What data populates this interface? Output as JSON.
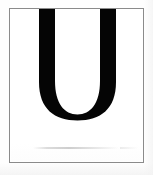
{
  "image": {
    "width": 153,
    "height": 175,
    "background_color": "#ffffff",
    "caption": "Bold sans-serif capital letter U inside a thin gray rectangular frame"
  },
  "frame": {
    "name": "glyph-frame",
    "border_color": "#8b8b8b",
    "border_width_px": 1,
    "fill_color": "#ffffff",
    "x": 9,
    "y": 8,
    "width": 135,
    "height": 155
  },
  "glyph": {
    "character": "U",
    "label": "Capital letter U",
    "color": "#050505",
    "style": "bold sans-serif",
    "left_stem_x": 39,
    "right_stem_x": 100,
    "stem_width_px": 16,
    "top_y": 9,
    "bowl_bottom_y": 120,
    "counter_color": "#ffffff"
  },
  "artifacts": {
    "scan_line_label": "faint horizontal scan smudge",
    "scan_line_color": "#d2d2d2",
    "scan_line_y": 147
  }
}
